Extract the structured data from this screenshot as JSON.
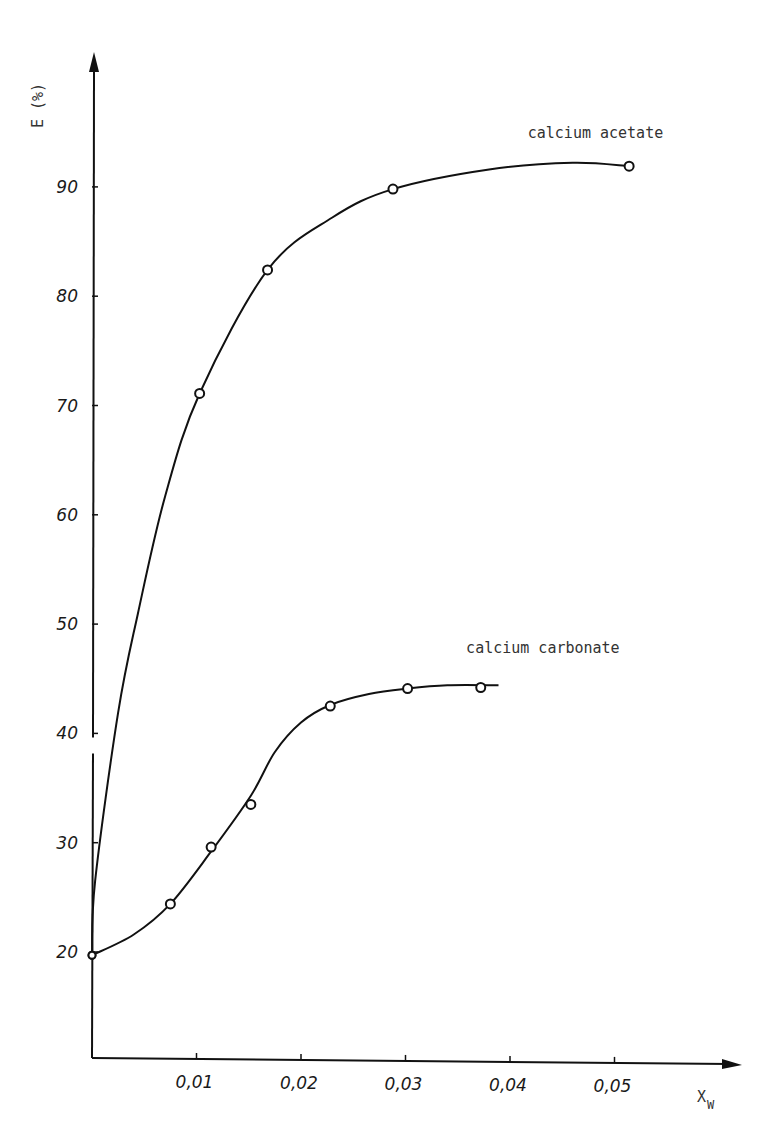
{
  "chart_data": {
    "type": "line",
    "title": "",
    "xlabel": "X",
    "xlabel_subscript": "W",
    "ylabel": "E (%)",
    "xlim": [
      0,
      0.058
    ],
    "ylim": [
      10,
      100
    ],
    "x_ticks": [
      0.01,
      0.02,
      0.03,
      0.04,
      0.05
    ],
    "x_tick_labels": [
      "0,01",
      "0,02",
      "0,03",
      "0,04",
      "0,05"
    ],
    "y_ticks": [
      20,
      30,
      40,
      50,
      60,
      70,
      80,
      90
    ],
    "y_tick_labels": [
      "20",
      "30",
      "40",
      "50",
      "60",
      "70",
      "80",
      "90"
    ],
    "y_axis_break_between": [
      40,
      42
    ],
    "grid": false,
    "legend": "inline labels at curve ends",
    "series": [
      {
        "name": "calcium acetate",
        "marker": "open-circle",
        "x": [
          0.0,
          0.0103,
          0.0168,
          0.0288,
          0.0514
        ],
        "y": [
          19.7,
          71.1,
          82.4,
          89.8,
          91.9
        ],
        "curve_x": [
          0.0,
          0.0003,
          0.0025,
          0.0044,
          0.007,
          0.0103,
          0.0168,
          0.023,
          0.0288,
          0.038,
          0.046,
          0.0514
        ],
        "curve_y": [
          19.7,
          26.5,
          41.9,
          51.0,
          61.7,
          71.1,
          82.4,
          87.2,
          89.8,
          91.6,
          92.2,
          91.9
        ],
        "label_position": {
          "x": 0.0417,
          "y": 94.5
        }
      },
      {
        "name": "calcium carbonate",
        "marker": "open-circle",
        "x": [
          0.0,
          0.0075,
          0.0114,
          0.0152,
          0.0228,
          0.0302,
          0.0372
        ],
        "y": [
          19.7,
          24.4,
          29.6,
          33.5,
          42.5,
          44.1,
          44.2
        ],
        "curve_x": [
          0.0,
          0.004,
          0.0075,
          0.0114,
          0.0152,
          0.0175,
          0.02,
          0.0228,
          0.0265,
          0.0302,
          0.034,
          0.0389
        ],
        "curve_y": [
          19.7,
          21.6,
          24.4,
          29.2,
          34.3,
          38.3,
          41.0,
          42.6,
          43.6,
          44.1,
          44.4,
          44.4
        ],
        "label_position": {
          "x": 0.0358,
          "y": 47.4
        }
      }
    ]
  }
}
